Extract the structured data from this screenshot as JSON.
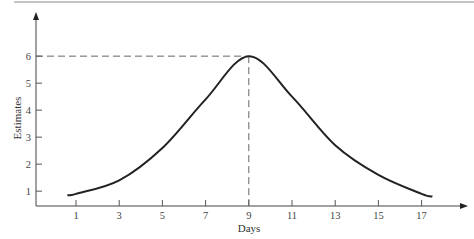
{
  "chart_data": {
    "type": "line",
    "title": "",
    "xlabel": "Days",
    "ylabel": "Estimates",
    "x_ticks": [
      1,
      3,
      5,
      7,
      9,
      11,
      13,
      15,
      17
    ],
    "y_ticks": [
      1,
      2,
      3,
      4,
      5,
      6
    ],
    "xlim": [
      -0.8,
      20
    ],
    "ylim": [
      0.4,
      6.6
    ],
    "grid": false,
    "legend": null,
    "series": [
      {
        "name": "Estimates",
        "x": [
          0.6,
          1,
          3,
          5,
          7,
          9,
          11,
          13,
          15,
          17,
          17.5
        ],
        "values": [
          0.85,
          0.9,
          1.4,
          2.6,
          4.4,
          6.0,
          4.5,
          2.7,
          1.6,
          0.9,
          0.8
        ]
      }
    ],
    "annotations": [
      {
        "type": "dashed-reference",
        "x": 9,
        "y": 6,
        "description": "Dashed lines marking peak at day 9, estimate 6"
      }
    ]
  },
  "labels": {
    "xlabel": "Days",
    "ylabel": "Estimates",
    "x_ticks": [
      "1",
      "3",
      "5",
      "7",
      "9",
      "11",
      "13",
      "15",
      "17"
    ],
    "y_ticks": [
      "1",
      "2",
      "3",
      "4",
      "5",
      "6"
    ]
  }
}
